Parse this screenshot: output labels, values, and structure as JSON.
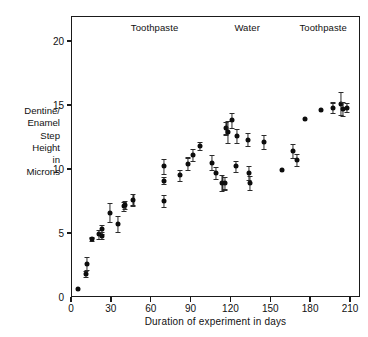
{
  "figure": {
    "background_color": "#ffffff",
    "ink_color": "#111111"
  },
  "chart_data": {
    "type": "scatter",
    "title": "",
    "xlabel": "Duration of experiment in days",
    "ylabel": "Dentine/ Enamel Step Height in Microns",
    "ylabel_lines": [
      "Dentine/",
      "Enamel",
      "Step",
      "Height",
      "in",
      "Microns"
    ],
    "xlim": [
      0,
      225
    ],
    "ylim": [
      0,
      21.8
    ],
    "xticks": [
      0,
      30,
      60,
      90,
      120,
      150,
      180,
      210
    ],
    "yticks": [
      0,
      5,
      10,
      15,
      20
    ],
    "xtick_labels": [
      "0",
      "30",
      "60",
      "90",
      "120",
      "150",
      "180",
      "210"
    ],
    "ytick_labels": [
      "0",
      "5",
      "10",
      "15",
      "20"
    ],
    "grid": false,
    "legend": false,
    "marker": "filled-circle",
    "error_bars": "vertical",
    "annotations": [
      {
        "text": "Toothpaste",
        "x": 45,
        "y": 21.0,
        "phase": "toothpaste-1"
      },
      {
        "text": "Water",
        "x": 123,
        "y": 21.0,
        "phase": "water"
      },
      {
        "text": "Toothpaste",
        "x": 172,
        "y": 21.0,
        "phase": "toothpaste-2"
      }
    ],
    "points": [
      {
        "x": 5,
        "y": 0.6,
        "err": 0.0
      },
      {
        "x": 11,
        "y": 1.8,
        "err": 0.2
      },
      {
        "x": 12,
        "y": 2.6,
        "err": 0.5
      },
      {
        "x": 16,
        "y": 4.5,
        "err": 0.15
      },
      {
        "x": 21,
        "y": 4.9,
        "err": 0.35
      },
      {
        "x": 23,
        "y": 5.3,
        "err": 0.35
      },
      {
        "x": 23,
        "y": 4.8,
        "err": 0.3
      },
      {
        "x": 29,
        "y": 6.6,
        "err": 0.75
      },
      {
        "x": 35,
        "y": 5.7,
        "err": 0.65
      },
      {
        "x": 40,
        "y": 7.1,
        "err": 0.35
      },
      {
        "x": 41,
        "y": 7.2,
        "err": 0.3
      },
      {
        "x": 47,
        "y": 7.6,
        "err": 0.45
      },
      {
        "x": 70,
        "y": 10.2,
        "err": 0.6
      },
      {
        "x": 70,
        "y": 9.1,
        "err": 0.25
      },
      {
        "x": 70,
        "y": 7.5,
        "err": 0.45
      },
      {
        "x": 82,
        "y": 9.5,
        "err": 0.4
      },
      {
        "x": 88,
        "y": 10.4,
        "err": 0.5
      },
      {
        "x": 92,
        "y": 11.1,
        "err": 0.5
      },
      {
        "x": 97,
        "y": 11.8,
        "err": 0.3
      },
      {
        "x": 106,
        "y": 10.5,
        "err": 0.6
      },
      {
        "x": 109,
        "y": 9.7,
        "err": 0.45
      },
      {
        "x": 114,
        "y": 8.9,
        "err": 0.6
      },
      {
        "x": 116,
        "y": 8.9,
        "err": 0.5
      },
      {
        "x": 117,
        "y": 13.2,
        "err": 0.5
      },
      {
        "x": 118,
        "y": 12.9,
        "err": 0.85
      },
      {
        "x": 121,
        "y": 13.8,
        "err": 0.6
      },
      {
        "x": 125,
        "y": 12.6,
        "err": 0.55
      },
      {
        "x": 124,
        "y": 10.2,
        "err": 0.45
      },
      {
        "x": 133,
        "y": 12.3,
        "err": 0.5
      },
      {
        "x": 134,
        "y": 9.7,
        "err": 0.55
      },
      {
        "x": 135,
        "y": 8.9,
        "err": 0.55
      },
      {
        "x": 145,
        "y": 12.1,
        "err": 0.55
      },
      {
        "x": 159,
        "y": 9.9,
        "err": 0.0
      },
      {
        "x": 167,
        "y": 11.4,
        "err": 0.55
      },
      {
        "x": 170,
        "y": 10.7,
        "err": 0.45
      },
      {
        "x": 176,
        "y": 13.9,
        "err": 0.0
      },
      {
        "x": 188,
        "y": 14.6,
        "err": 0.0
      },
      {
        "x": 197,
        "y": 14.8,
        "err": 0.4
      },
      {
        "x": 203,
        "y": 15.1,
        "err": 0.9
      },
      {
        "x": 205,
        "y": 14.7,
        "err": 0.55
      },
      {
        "x": 208,
        "y": 14.8,
        "err": 0.35
      }
    ]
  }
}
